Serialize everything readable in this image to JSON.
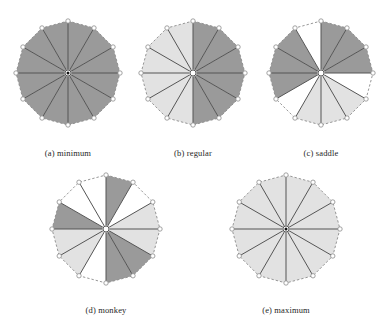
{
  "figure": {
    "title": "",
    "panel_count": 5,
    "sector_count": 12,
    "colors": {
      "dark_sector": "#9a9a9a",
      "light_sector": "#e2e2e2",
      "white_sector": "#ffffff",
      "spoke_line": "#555555",
      "boundary_dashed": "#8c8c8c",
      "vertex_marker_fill": "#ffffff",
      "vertex_marker_stroke": "#8c8c8c",
      "hub_outer": "#ffffff",
      "hub_ring": "#4a4a4a",
      "hub_dot": "#101010",
      "caption_text": "#262626",
      "background": "#ffffff"
    },
    "legend": {
      "dark_means": "negative",
      "light_means": "positive",
      "white_means": "unshaded"
    }
  },
  "panels": [
    {
      "id": "a",
      "caption": "(a) minimum",
      "radius": 52,
      "sector_count": 12,
      "has_center_dot": true,
      "sectors": [
        "dark",
        "dark",
        "dark",
        "dark",
        "dark",
        "dark",
        "dark",
        "dark",
        "dark",
        "dark",
        "dark",
        "dark"
      ]
    },
    {
      "id": "b",
      "caption": "(b) regular",
      "radius": 52,
      "sector_count": 12,
      "has_center_dot": false,
      "sectors": [
        "dark",
        "dark",
        "dark",
        "dark",
        "dark",
        "dark",
        "light",
        "light",
        "light",
        "light",
        "light",
        "light"
      ]
    },
    {
      "id": "c",
      "caption": "(c) saddle",
      "radius": 52,
      "sector_count": 12,
      "has_center_dot": false,
      "sectors": [
        "dark",
        "dark",
        "dark",
        "white",
        "light",
        "light",
        "light",
        "white",
        "dark",
        "dark",
        "dark",
        "white"
      ]
    },
    {
      "id": "d",
      "caption": "(d) monkey",
      "radius": 54,
      "sector_count": 12,
      "has_center_dot": false,
      "sectors": [
        "dark",
        "white",
        "light",
        "light",
        "dark",
        "dark",
        "white",
        "light",
        "light",
        "dark",
        "white",
        "white"
      ]
    },
    {
      "id": "e",
      "caption": "(e) maximum",
      "radius": 54,
      "sector_count": 12,
      "has_center_dot": true,
      "sectors": [
        "light",
        "light",
        "light",
        "light",
        "light",
        "light",
        "light",
        "light",
        "light",
        "light",
        "light",
        "light"
      ]
    }
  ],
  "chart_data": {
    "type": "pie",
    "xlabel": "",
    "ylabel": "",
    "legend_position": "none",
    "grid": false,
    "series": [
      {
        "name": "(a) minimum",
        "categories": [
          "s1",
          "s2",
          "s3",
          "s4",
          "s5",
          "s6",
          "s7",
          "s8",
          "s9",
          "s10",
          "s11",
          "s12"
        ],
        "values": [
          30,
          30,
          30,
          30,
          30,
          30,
          30,
          30,
          30,
          30,
          30,
          30
        ],
        "shading": [
          "dark",
          "dark",
          "dark",
          "dark",
          "dark",
          "dark",
          "dark",
          "dark",
          "dark",
          "dark",
          "dark",
          "dark"
        ],
        "sign_changes": 0,
        "index": 1
      },
      {
        "name": "(b) regular",
        "categories": [
          "s1",
          "s2",
          "s3",
          "s4",
          "s5",
          "s6",
          "s7",
          "s8",
          "s9",
          "s10",
          "s11",
          "s12"
        ],
        "values": [
          30,
          30,
          30,
          30,
          30,
          30,
          30,
          30,
          30,
          30,
          30,
          30
        ],
        "shading": [
          "dark",
          "dark",
          "dark",
          "dark",
          "dark",
          "dark",
          "light",
          "light",
          "light",
          "light",
          "light",
          "light"
        ],
        "sign_changes": 2,
        "index": 0
      },
      {
        "name": "(c) saddle",
        "categories": [
          "s1",
          "s2",
          "s3",
          "s4",
          "s5",
          "s6",
          "s7",
          "s8",
          "s9",
          "s10",
          "s11",
          "s12"
        ],
        "values": [
          30,
          30,
          30,
          30,
          30,
          30,
          30,
          30,
          30,
          30,
          30,
          30
        ],
        "shading": [
          "dark",
          "dark",
          "dark",
          "white",
          "light",
          "light",
          "light",
          "white",
          "dark",
          "dark",
          "dark",
          "white"
        ],
        "sign_changes": 4,
        "index": -1
      },
      {
        "name": "(d) monkey",
        "categories": [
          "s1",
          "s2",
          "s3",
          "s4",
          "s5",
          "s6",
          "s7",
          "s8",
          "s9",
          "s10",
          "s11",
          "s12"
        ],
        "values": [
          30,
          30,
          30,
          30,
          30,
          30,
          30,
          30,
          30,
          30,
          30,
          30
        ],
        "shading": [
          "dark",
          "white",
          "light",
          "light",
          "dark",
          "dark",
          "white",
          "light",
          "light",
          "dark",
          "white",
          "white"
        ],
        "sign_changes": 6,
        "index": -2
      },
      {
        "name": "(e) maximum",
        "categories": [
          "s1",
          "s2",
          "s3",
          "s4",
          "s5",
          "s6",
          "s7",
          "s8",
          "s9",
          "s10",
          "s11",
          "s12"
        ],
        "values": [
          30,
          30,
          30,
          30,
          30,
          30,
          30,
          30,
          30,
          30,
          30,
          30
        ],
        "shading": [
          "light",
          "light",
          "light",
          "light",
          "light",
          "light",
          "light",
          "light",
          "light",
          "light",
          "light",
          "light"
        ],
        "sign_changes": 0,
        "index": 1
      }
    ]
  }
}
